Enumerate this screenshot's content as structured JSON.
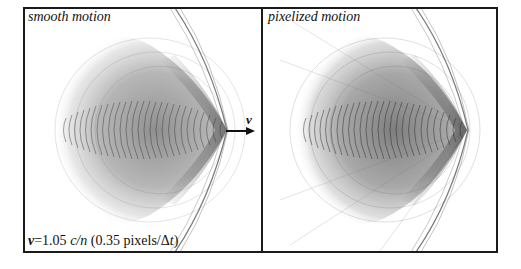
{
  "figure": {
    "panels": [
      {
        "id": "left",
        "title": "smooth motion"
      },
      {
        "id": "right",
        "title": "pixelized motion"
      }
    ],
    "velocity_arrow_label": "v",
    "caption": {
      "v_symbol": "v",
      "equals_value": "=1.05 ",
      "c_over_n": "c/n",
      "paren_open": " (0.35 pixels/Δ",
      "t_symbol": "t",
      "paren_close": ")"
    },
    "colors": {
      "frame": "#1a1a1a",
      "background": "#ffffff",
      "pattern": "#222222"
    }
  }
}
